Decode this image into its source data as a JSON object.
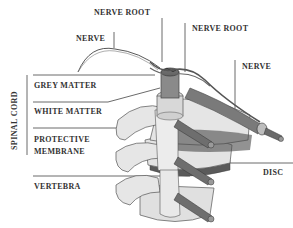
{
  "diagram": {
    "labels": {
      "nerve_root_top": "NERVE ROOT",
      "nerve_root_right": "NERVE ROOT",
      "nerve_left": "NERVE",
      "nerve_right": "NERVE",
      "spinal_cord": "SPINAL CORD",
      "grey_matter": "GREY MATTER",
      "white_matter": "WHITE MATTER",
      "protective_membrane_1": "PROTECTIVE",
      "protective_membrane_2": "MEMBRANE",
      "vertebra": "VERTEBRA",
      "disc": "DISC"
    },
    "colors": {
      "background": "#ffffff",
      "text": "#333333",
      "line": "#444444",
      "bone_fill": "#e2e2e2",
      "cord_fill": "#8a8a8a",
      "nerve_fill": "#6e6e6e"
    }
  }
}
